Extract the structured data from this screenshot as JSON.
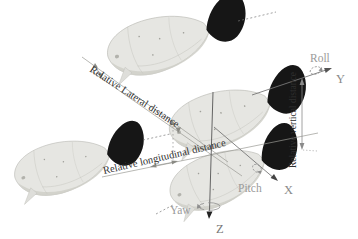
{
  "figure": {
    "distance_labels": {
      "lateral": "Relative Lateral distance",
      "longitudinal": "Relative longitudinal distance",
      "vertical": "Relative vertical distance"
    },
    "axis_labels": {
      "x": "X",
      "y": "Y",
      "z": "Z"
    },
    "rotation_labels": {
      "roll": "Roll",
      "pitch": "Pitch",
      "yaw": "Yaw"
    },
    "robots": {
      "count": 4,
      "kind": "robotic fish with black caudal fin"
    },
    "colors": {
      "background": "#ffffff",
      "fish_body": "#e6e6e2",
      "fish_fin": "#161616",
      "dimension_line": "#9a9a94",
      "axis_line": "#777777",
      "distance_text": "#2f2f2f",
      "axis_text": "#8a8a8a"
    }
  }
}
